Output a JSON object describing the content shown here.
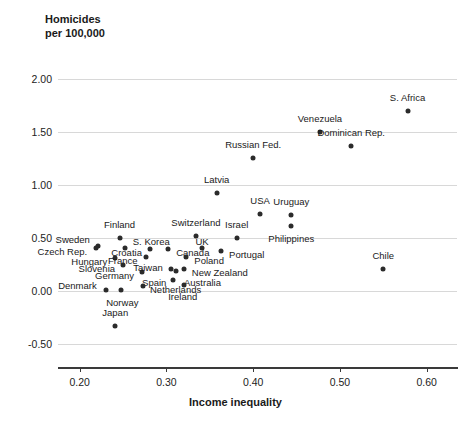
{
  "chart_data": {
    "type": "scatter",
    "title": "",
    "ylabel_line1": "Homicides",
    "ylabel_line2": "per 100,000",
    "xlabel": "Income inequality",
    "xlim": [
      0.175,
      0.635
    ],
    "ylim": [
      -0.62,
      2.18
    ],
    "grid": true,
    "legend": "none",
    "point_color": "#2b2b2b",
    "grid_color": "#d8d8d8",
    "axis_color": "#3a3a3a",
    "y_ticks": [
      "2.00",
      "1.50",
      "1.00",
      "0.50",
      "0.00",
      "-0.50"
    ],
    "y_tick_values": [
      2.0,
      1.5,
      1.0,
      0.5,
      0.0,
      -0.5
    ],
    "x_ticks": [
      "0.20",
      "0.30",
      "0.40",
      "0.50",
      "0.60"
    ],
    "x_tick_values": [
      0.2,
      0.3,
      0.4,
      0.5,
      0.6
    ],
    "points": [
      {
        "label": "S. Africa",
        "x": 0.578,
        "y": 1.695,
        "lx": 0,
        "ly": -13,
        "anchor": "mid"
      },
      {
        "label": "Venezuela",
        "x": 0.477,
        "y": 1.505,
        "lx": 0,
        "ly": -13,
        "anchor": "mid"
      },
      {
        "label": "Dominican Rep.",
        "x": 0.513,
        "y": 1.37,
        "lx": 0,
        "ly": -13,
        "anchor": "mid"
      },
      {
        "label": "Russian Fed.",
        "x": 0.4,
        "y": 1.255,
        "lx": 0,
        "ly": -13,
        "anchor": "mid"
      },
      {
        "label": "Latvia",
        "x": 0.358,
        "y": 0.93,
        "lx": 0,
        "ly": -13,
        "anchor": "mid"
      },
      {
        "label": "USA",
        "x": 0.408,
        "y": 0.725,
        "lx": 0,
        "ly": -13,
        "anchor": "mid"
      },
      {
        "label": "Uruguay",
        "x": 0.444,
        "y": 0.72,
        "lx": 0,
        "ly": -13,
        "anchor": "mid"
      },
      {
        "label": "Philippines",
        "x": 0.444,
        "y": 0.615,
        "lx": 0,
        "ly": 13,
        "anchor": "mid"
      },
      {
        "label": "Switzerland",
        "x": 0.334,
        "y": 0.525,
        "lx": 0,
        "ly": -13,
        "anchor": "mid"
      },
      {
        "label": "Israel",
        "x": 0.381,
        "y": 0.5,
        "lx": 0,
        "ly": -13,
        "anchor": "mid"
      },
      {
        "label": "Finland",
        "x": 0.246,
        "y": 0.505,
        "lx": 0,
        "ly": -13,
        "anchor": "mid"
      },
      {
        "label": "Sweden",
        "x": 0.221,
        "y": 0.43,
        "lx": -8,
        "ly": -6,
        "anchor": "end"
      },
      {
        "label": "Czech Rep.",
        "x": 0.219,
        "y": 0.405,
        "lx": -9,
        "ly": 4,
        "anchor": "end"
      },
      {
        "label": "S. Korea",
        "x": 0.252,
        "y": 0.405,
        "lx": 8,
        "ly": -6,
        "anchor": "start"
      },
      {
        "label": "Croatia",
        "x": 0.281,
        "y": 0.4,
        "lx": -8,
        "ly": 4,
        "anchor": "end"
      },
      {
        "label": "Canada",
        "x": 0.302,
        "y": 0.4,
        "lx": 8,
        "ly": 4,
        "anchor": "start"
      },
      {
        "label": "UK",
        "x": 0.341,
        "y": 0.41,
        "lx": 0,
        "ly": -6,
        "anchor": "mid"
      },
      {
        "label": "Portugal",
        "x": 0.363,
        "y": 0.38,
        "lx": 8,
        "ly": 4,
        "anchor": "start"
      },
      {
        "label": "Hungary",
        "x": 0.241,
        "y": 0.315,
        "lx": -8,
        "ly": 4,
        "anchor": "end"
      },
      {
        "label": "France",
        "x": 0.276,
        "y": 0.325,
        "lx": -8,
        "ly": 4,
        "anchor": "end"
      },
      {
        "label": "Poland",
        "x": 0.323,
        "y": 0.32,
        "lx": 8,
        "ly": 4,
        "anchor": "start"
      },
      {
        "label": "Slovenia",
        "x": 0.25,
        "y": 0.245,
        "lx": -8,
        "ly": 4,
        "anchor": "end"
      },
      {
        "label": "Germany",
        "x": 0.272,
        "y": 0.185,
        "lx": -8,
        "ly": 4,
        "anchor": "end"
      },
      {
        "label": "Taiwan",
        "x": 0.305,
        "y": 0.205,
        "lx": -8,
        "ly": -1,
        "anchor": "end"
      },
      {
        "label": "New Zealand",
        "x": 0.32,
        "y": 0.205,
        "lx": 8,
        "ly": 4,
        "anchor": "start"
      },
      {
        "label": "Australia",
        "x": 0.311,
        "y": 0.19,
        "lx": 8,
        "ly": 12,
        "anchor": "start"
      },
      {
        "label": "Spain",
        "x": 0.308,
        "y": 0.105,
        "lx": -7,
        "ly": 3,
        "anchor": "end"
      },
      {
        "label": "Netherlands",
        "x": 0.273,
        "y": 0.045,
        "lx": 7,
        "ly": 4,
        "anchor": "start"
      },
      {
        "label": "Ireland",
        "x": 0.32,
        "y": 0.06,
        "lx": -1,
        "ly": 12,
        "anchor": "mid"
      },
      {
        "label": "Denmark",
        "x": 0.23,
        "y": 0.015,
        "lx": -9,
        "ly": -4,
        "anchor": "end"
      },
      {
        "label": "Norway",
        "x": 0.248,
        "y": 0.015,
        "lx": 1,
        "ly": 13,
        "anchor": "mid"
      },
      {
        "label": "Japan",
        "x": 0.241,
        "y": -0.33,
        "lx": 0,
        "ly": -13,
        "anchor": "mid"
      },
      {
        "label": "Chile",
        "x": 0.55,
        "y": 0.205,
        "lx": 0,
        "ly": -13,
        "anchor": "mid"
      }
    ]
  }
}
